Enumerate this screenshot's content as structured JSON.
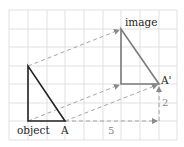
{
  "diagram": {
    "labels": {
      "object": "object",
      "image": "image",
      "vertex_a": "A",
      "vertex_a_prime": "A'",
      "horizontal_shift": "5",
      "vertical_shift": "2"
    },
    "colors": {
      "grid": "#d6d6d6",
      "object": "#222222",
      "image": "#7a7a7a",
      "dashed": "#9a9a9a",
      "text": "#222222",
      "measure_text": "#888888"
    },
    "translation": {
      "dx": 5,
      "dy": 2
    }
  }
}
